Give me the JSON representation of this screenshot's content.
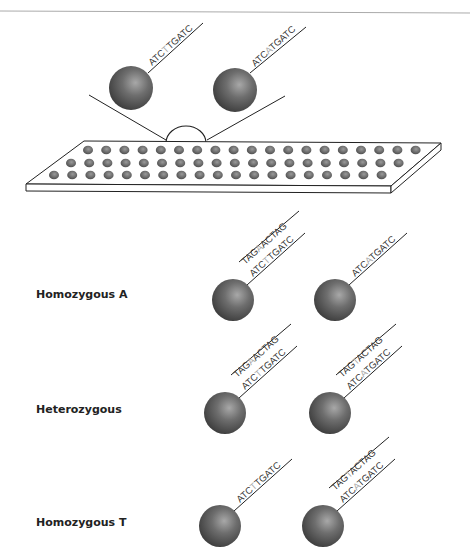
{
  "probes": [
    {
      "seq_pre": "ATC",
      "snp": "T",
      "seq_post": "TGATC"
    },
    {
      "seq_pre": "ATC",
      "snp": "A",
      "seq_post": "TGATC"
    }
  ],
  "rows": [
    {
      "label": "Homozygous A",
      "beads": [
        {
          "target": {
            "pre": "TAG",
            "snp": "A",
            "post": "ACTAG"
          },
          "probe": {
            "pre": "ATC",
            "snp": "T",
            "post": "TGATC"
          }
        },
        {
          "target": null,
          "probe": {
            "pre": "ATC",
            "snp": "A",
            "post": "TGATC"
          }
        }
      ]
    },
    {
      "label": "Heterozygous",
      "beads": [
        {
          "target": {
            "pre": "TAG",
            "snp": "A",
            "post": "ACTAG"
          },
          "probe": {
            "pre": "ATC",
            "snp": "T",
            "post": "TGATC"
          }
        },
        {
          "target": {
            "pre": "TAG",
            "snp": "T",
            "post": "ACTAG"
          },
          "probe": {
            "pre": "ATC",
            "snp": "A",
            "post": "TGATC"
          }
        }
      ]
    },
    {
      "label": "Homozygous T",
      "beads": [
        {
          "target": null,
          "probe": {
            "pre": "ATC",
            "snp": "T",
            "post": "TGATC"
          }
        },
        {
          "target": {
            "pre": "TAG",
            "snp": "T",
            "post": "ACTAG"
          },
          "probe": {
            "pre": "ATC",
            "snp": "A",
            "post": "TGATC"
          }
        }
      ]
    }
  ],
  "colors": {
    "bead": "#666666",
    "highlight": "#aaaaaa",
    "line": "#222222"
  }
}
